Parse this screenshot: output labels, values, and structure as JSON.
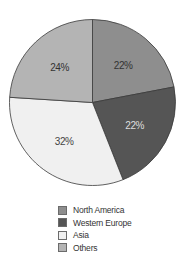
{
  "chart_data": {
    "type": "pie",
    "title": "",
    "categories": [
      "North America",
      "Western Europe",
      "Asia",
      "Others"
    ],
    "values": [
      22,
      22,
      32,
      24
    ],
    "labels": [
      "22%",
      "22%",
      "32%",
      "24%"
    ],
    "colors": [
      "#8e8e8e",
      "#555555",
      "#f0f0f0",
      "#b4b4b4"
    ],
    "label_colors": [
      "#333333",
      "#dddddd",
      "#444444",
      "#333333"
    ],
    "start_angle_deg": 0,
    "direction": "clockwise",
    "legend_position": "bottom"
  },
  "legend": {
    "items": [
      {
        "label": "North America",
        "color": "#8e8e8e"
      },
      {
        "label": "Western Europe",
        "color": "#555555"
      },
      {
        "label": "Asia",
        "color": "#f0f0f0"
      },
      {
        "label": "Others",
        "color": "#b4b4b4"
      }
    ]
  }
}
